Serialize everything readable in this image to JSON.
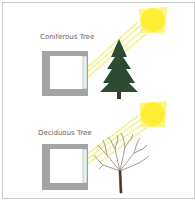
{
  "panels": [
    {
      "title": "Coniferous Tree",
      "tree_type": "coniferous"
    },
    {
      "title": "Deciduous Tree",
      "tree_type": "deciduous"
    }
  ],
  "colors": {
    "sun": "#ffee33",
    "sunbeam": "#f6f07a",
    "wall": "#a4a4a6",
    "window": "#d6eef0",
    "conifer": "#2f4a32",
    "trunk": "#4a3420",
    "branches": "#5a4a3a"
  }
}
